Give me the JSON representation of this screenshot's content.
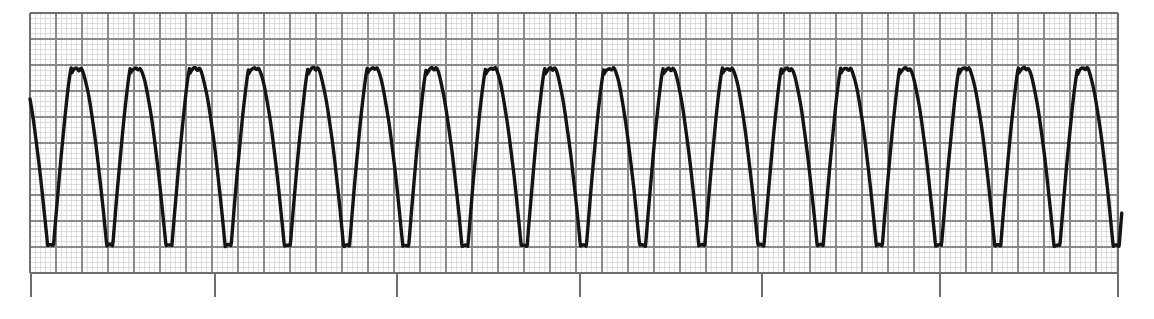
{
  "document": {
    "kind": "ecg-rhythm-strip",
    "paper_color": "#ffffff",
    "trace_color": "#141414",
    "fine_grid_color": "#c8c8c8",
    "bold_grid_color": "#8a8a8a",
    "border_color": "#6e6e6e",
    "tick_color": "#6e6e6e"
  },
  "grid": {
    "left": 30,
    "top": 13,
    "right": 1118,
    "bottom": 273,
    "fine_spacing_px": 5.2,
    "bold_spacing_px": 26,
    "fine_line_width": 0.6,
    "bold_line_width": 1.1,
    "border_line_width": 1.4,
    "show_fine_grid": true,
    "show_bold_grid": true
  },
  "timing_ticks": {
    "y_top": 273,
    "y_bottom": 297,
    "line_width": 1.3,
    "positions": [
      31,
      215,
      397,
      580,
      762,
      940,
      1118
    ]
  },
  "chart_data": {
    "type": "line",
    "title": "",
    "subtitle": "",
    "xlabel": "",
    "ylabel": "",
    "grid": true,
    "legend": false,
    "xlim": [
      30,
      1122
    ],
    "ylim": [
      13,
      273
    ],
    "baseline_y": 158,
    "peak_y": 68,
    "trough_y": 246,
    "period_px": 59.2,
    "phase_px": 12,
    "cycles_visible": 18,
    "series": [
      {
        "name": "ecg-trace",
        "color": "#141414",
        "stroke_width": 3.4,
        "description": "continuous wide-complex sine-like oscillation, rounded asymmetric peaks and narrow sharp troughs"
      }
    ]
  }
}
